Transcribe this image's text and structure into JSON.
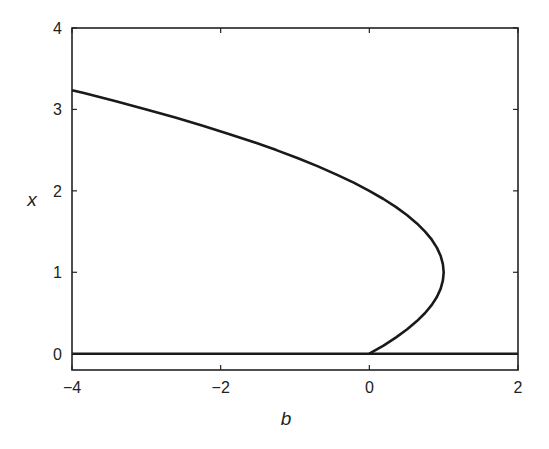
{
  "chart_data": {
    "type": "line",
    "title": "",
    "xlabel": "b",
    "ylabel": "x",
    "xlim": [
      -4,
      2
    ],
    "ylim": [
      -0.2,
      4
    ],
    "xticks": [
      -4,
      -2,
      0,
      2
    ],
    "xtick_labels": [
      "−4",
      "−2",
      "0",
      "2"
    ],
    "yticks": [
      0,
      1,
      2,
      3,
      4
    ],
    "ytick_labels": [
      "0",
      "1",
      "2",
      "3",
      "4"
    ],
    "grid": false,
    "legend": null,
    "series": [
      {
        "name": "x = 0 branch",
        "x": [
          -4,
          2
        ],
        "y": [
          0,
          0
        ]
      },
      {
        "name": "b = x(2 - x) branch",
        "x": [
          0,
          0.19,
          0.36,
          0.51,
          0.64,
          0.75,
          0.84,
          0.91,
          0.96,
          0.99,
          1.0,
          0.99,
          0.96,
          0.91,
          0.84,
          0.75,
          0.64,
          0.51,
          0.36,
          0.19,
          0,
          -0.21,
          -0.44,
          -0.69,
          -0.96,
          -1.25,
          -1.56,
          -1.89,
          -2.24,
          -2.61,
          -3.0,
          -3.41,
          -3.84,
          -4.0
        ],
        "y": [
          0,
          0.1,
          0.2,
          0.3,
          0.4,
          0.5,
          0.6,
          0.7,
          0.8,
          0.9,
          1.0,
          1.1,
          1.2,
          1.3,
          1.4,
          1.5,
          1.6,
          1.7,
          1.8,
          1.9,
          2.0,
          2.1,
          2.2,
          2.3,
          2.4,
          2.5,
          2.6,
          2.7,
          2.8,
          2.9,
          3.0,
          3.1,
          3.2,
          3.236
        ]
      }
    ]
  }
}
